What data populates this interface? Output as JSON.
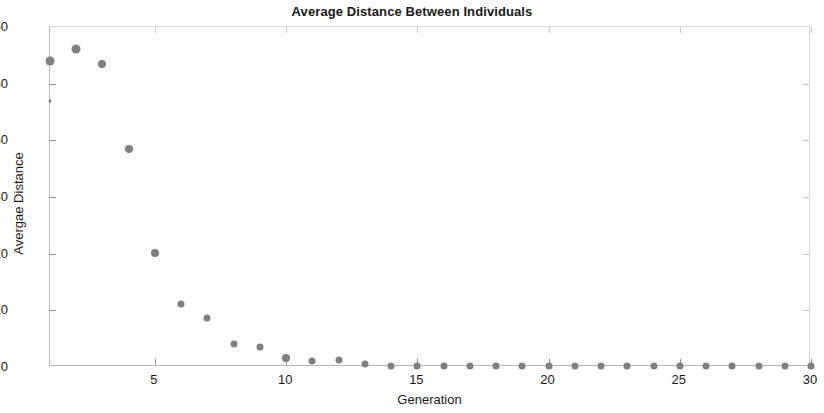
{
  "chart_data": {
    "type": "scatter",
    "title": "Average Distance Between Individuals",
    "xlabel": "Generation",
    "ylabel": "Avergae Distance",
    "xlim": [
      1,
      30
    ],
    "ylim": [
      0,
      60
    ],
    "xticks": [
      5,
      10,
      15,
      20,
      25,
      30
    ],
    "yticks": [
      0,
      10,
      20,
      30,
      40,
      50,
      60
    ],
    "grid": false,
    "legend": null,
    "marker_color": "#808080",
    "x": [
      1,
      1,
      2,
      3,
      4,
      5,
      6,
      7,
      8,
      9,
      10,
      11,
      12,
      13,
      14,
      15,
      16,
      17,
      18,
      19,
      20,
      21,
      22,
      23,
      24,
      25,
      26,
      27,
      28,
      29,
      30
    ],
    "y": [
      54.0,
      47.0,
      56.2,
      53.5,
      38.4,
      20.1,
      11.2,
      8.7,
      4.0,
      3.5,
      1.6,
      1.1,
      1.2,
      0.6,
      0.25,
      0.2,
      0.2,
      0.25,
      0.2,
      0.2,
      0.25,
      0.2,
      0.2,
      0.25,
      0.25,
      0.2,
      0.2,
      0.2,
      0.2,
      0.2,
      0.2
    ],
    "point_sizes": [
      9,
      3,
      9,
      8,
      8,
      8,
      7,
      7,
      7,
      7,
      8,
      7,
      7,
      7,
      7,
      7,
      7,
      7,
      7,
      7,
      7,
      7,
      7,
      7,
      7,
      7,
      7,
      7,
      7,
      7,
      7
    ]
  }
}
